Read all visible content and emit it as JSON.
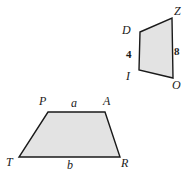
{
  "figure": {
    "background_color": "#ffffff",
    "fill_color": "#e3e3e3",
    "stroke_color": "#1a1a1a",
    "shapes": [
      {
        "name": "trapezoid-DZOI",
        "vertices": [
          {
            "label": "D",
            "x": 140,
            "y": 32
          },
          {
            "label": "Z",
            "x": 172,
            "y": 18
          },
          {
            "label": "O",
            "x": 173,
            "y": 78
          },
          {
            "label": "I",
            "x": 139,
            "y": 70
          }
        ],
        "side_labels": [
          {
            "label": "4",
            "side": "DI",
            "type": "measure"
          },
          {
            "label": "8",
            "side": "ZO",
            "type": "measure"
          }
        ]
      },
      {
        "name": "trapezoid-PATR",
        "vertices": [
          {
            "label": "P",
            "x": 48,
            "y": 112
          },
          {
            "label": "A",
            "x": 105,
            "y": 112
          },
          {
            "label": "R",
            "x": 120,
            "y": 157
          },
          {
            "label": "T",
            "x": 19,
            "y": 157
          }
        ],
        "side_labels": [
          {
            "label": "a",
            "side": "PA",
            "type": "variable"
          },
          {
            "label": "b",
            "side": "TR",
            "type": "variable"
          }
        ]
      }
    ]
  },
  "labels": {
    "D": "D",
    "Z": "Z",
    "I": "I",
    "O": "O",
    "four": "4",
    "eight": "8",
    "P": "P",
    "A": "A",
    "T": "T",
    "R": "R",
    "a": "a",
    "b": "b"
  }
}
